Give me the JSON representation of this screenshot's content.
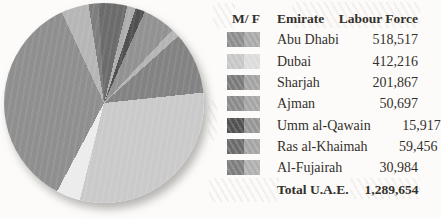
{
  "table": {
    "headers": {
      "mf": "M/ F",
      "emirate": "Emirate",
      "labour_force": "Labour Force"
    },
    "rows": [
      {
        "emirate": "Abu Dhabi",
        "labour_force": "518,517",
        "male_color": "#8e8e8e",
        "female_color": "#aaaaaa"
      },
      {
        "emirate": "Dubai",
        "labour_force": "412,216",
        "male_color": "#c7c7c7",
        "female_color": "#dcdcdc"
      },
      {
        "emirate": "Sharjah",
        "labour_force": "201,867",
        "male_color": "#7b7b7b",
        "female_color": "#a3a3a3"
      },
      {
        "emirate": "Ajman",
        "labour_force": "50,697",
        "male_color": "#8b8b8b",
        "female_color": "#a6a6a6"
      },
      {
        "emirate": "Umm al-Qawain",
        "labour_force": "15,917",
        "male_color": "#525252",
        "female_color": "#969696"
      },
      {
        "emirate": "Ras al-Khaimah",
        "labour_force": "59,456",
        "male_color": "#6b6b6b",
        "female_color": "#a5a5a5"
      },
      {
        "emirate": "Al-Fujairah",
        "labour_force": "30,984",
        "male_color": "#7e7e7e",
        "female_color": "#b0b0b0"
      }
    ],
    "total": {
      "label": "Total U.A.E.",
      "value": "1,289,654"
    }
  },
  "chart_data": {
    "type": "pie",
    "title": "",
    "legend_position": "right",
    "categories": [
      "Abu Dhabi",
      "Dubai",
      "Sharjah",
      "Ajman",
      "Umm al-Qawain",
      "Ras al-Khaimah",
      "Al-Fujairah"
    ],
    "values": [
      518517,
      412216,
      201867,
      50697,
      15917,
      59456,
      30984
    ],
    "total_label": "Total U.A.E.",
    "total_value": 1289654,
    "note": "Each emirate is drawn as a male (darker) and female (lighter) slice pair; M/F split is unlabeled, slice angles estimated from the image. Angles are degrees clockwise from 12 o'clock.",
    "slices": [
      {
        "name": "Ras al-Khaimah (M)",
        "from": 0,
        "to": 13.5,
        "color": "#6c6c6c"
      },
      {
        "name": "Ras al-Khaimah (F)",
        "from": 13.5,
        "to": 18.5,
        "color": "#adadad"
      },
      {
        "name": "Umm al-Qawain (M)",
        "from": 18.5,
        "to": 24,
        "color": "#505050"
      },
      {
        "name": "Ajman (M)",
        "from": 24,
        "to": 43,
        "color": "#929292"
      },
      {
        "name": "Ajman (F)",
        "from": 43,
        "to": 48,
        "color": "#b5b5b5"
      },
      {
        "name": "Sharjah (M)",
        "from": 48,
        "to": 84,
        "color": "#838383"
      },
      {
        "name": "Dubai (M)",
        "from": 84,
        "to": 194,
        "color": "#cacaca"
      },
      {
        "name": "Dubai (F)",
        "from": 194,
        "to": 208,
        "color": "#ececec"
      },
      {
        "name": "Abu Dhabi (M)",
        "from": 208,
        "to": 335,
        "color": "#8f8f8f"
      },
      {
        "name": "Abu Dhabi (F)",
        "from": 335,
        "to": 351,
        "color": "#b6b6b6"
      },
      {
        "name": "Al-Fujairah (M)",
        "from": 351,
        "to": 357,
        "color": "#7e7e7e"
      },
      {
        "name": "Ras al-Khaimah (M)",
        "from": 357,
        "to": 360,
        "color": "#6c6c6c"
      }
    ]
  }
}
